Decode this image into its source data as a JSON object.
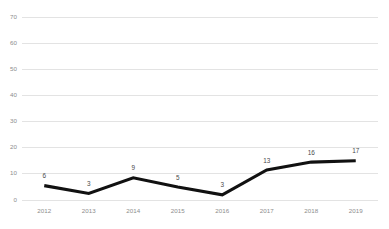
{
  "chart_data": {
    "type": "line",
    "title": "",
    "subtitle": "",
    "xlabel": "",
    "ylabel": "",
    "categories": [
      "2012",
      "2013",
      "2014",
      "2015",
      "2016",
      "2017",
      "2018",
      "2019"
    ],
    "values": [
      6,
      3,
      9,
      5,
      3,
      13,
      16,
      17
    ],
    "plotted_values": [
      5.5,
      2.5,
      8.5,
      5.0,
      2.0,
      11.5,
      14.5,
      15.0
    ],
    "data_labels": [
      "6",
      "3",
      "9",
      "5",
      "3",
      "13",
      "16",
      "17"
    ],
    "series": [
      {
        "name": "",
        "values": [
          6,
          3,
          9,
          5,
          3,
          13,
          16,
          17
        ],
        "color": "#111111"
      }
    ],
    "ylim": [
      0,
      70
    ],
    "yticks": [
      0,
      10,
      20,
      30,
      40,
      50,
      60,
      70
    ],
    "ytick_labels": [
      "0",
      "10",
      "20",
      "30",
      "40",
      "50",
      "60",
      "70"
    ],
    "grid": true,
    "grid_axis": "y",
    "grid_color": "#dcdcdc",
    "legend": false,
    "legend_position": "none",
    "background_color": "#ffffff",
    "axis_label_color": "#8d8d8d",
    "data_label_color": "#4a4a4a"
  }
}
